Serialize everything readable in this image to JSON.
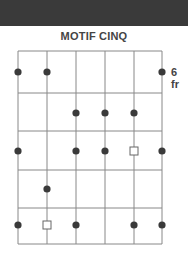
{
  "header": {
    "band_color": "#3a3a3a"
  },
  "diagram": {
    "title": "MOTIF CINQ",
    "fret_label": "6 fr",
    "strings_x": [
      18,
      47,
      76,
      105,
      134,
      162
    ],
    "frets_y": [
      51,
      93,
      131,
      170,
      208,
      244
    ],
    "row_centers_y": [
      72,
      113,
      151,
      189,
      225
    ],
    "line_color": "#888888",
    "dot_color": "#3a3a3a",
    "markers": [
      {
        "row": 0,
        "string": 0,
        "type": "dot"
      },
      {
        "row": 0,
        "string": 1,
        "type": "dot"
      },
      {
        "row": 0,
        "string": 5,
        "type": "dot"
      },
      {
        "row": 1,
        "string": 2,
        "type": "dot"
      },
      {
        "row": 1,
        "string": 3,
        "type": "dot"
      },
      {
        "row": 1,
        "string": 4,
        "type": "dot"
      },
      {
        "row": 2,
        "string": 0,
        "type": "dot"
      },
      {
        "row": 2,
        "string": 2,
        "type": "dot"
      },
      {
        "row": 2,
        "string": 3,
        "type": "dot"
      },
      {
        "row": 2,
        "string": 4,
        "type": "square"
      },
      {
        "row": 2,
        "string": 5,
        "type": "dot"
      },
      {
        "row": 3,
        "string": 1,
        "type": "dot"
      },
      {
        "row": 4,
        "string": 0,
        "type": "dot"
      },
      {
        "row": 4,
        "string": 1,
        "type": "square"
      },
      {
        "row": 4,
        "string": 2,
        "type": "dot"
      },
      {
        "row": 4,
        "string": 4,
        "type": "dot"
      },
      {
        "row": 4,
        "string": 5,
        "type": "dot"
      }
    ]
  }
}
